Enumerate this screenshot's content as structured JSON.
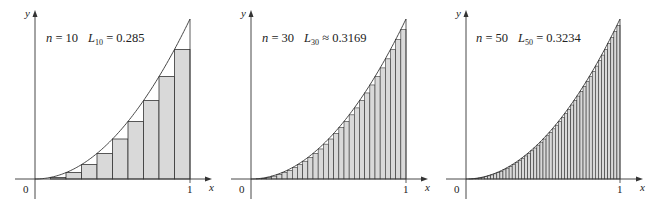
{
  "figure": {
    "colors": {
      "bar_fill": "#d9d9d9",
      "stroke": "#333333",
      "background": "#ffffff"
    }
  },
  "panels": [
    {
      "n_label": "n = 10",
      "L_symbol": "L",
      "L_sub": "10",
      "relation": "=",
      "L_value": "0.285",
      "axis_x_label": "x",
      "axis_y_label": "y",
      "origin_label": "0",
      "tick_x_label": "1"
    },
    {
      "n_label": "n = 30",
      "L_symbol": "L",
      "L_sub": "30",
      "relation": "≈",
      "L_value": "0.3169",
      "axis_x_label": "x",
      "axis_y_label": "y",
      "origin_label": "0",
      "tick_x_label": "1"
    },
    {
      "n_label": "n = 50",
      "L_symbol": "L",
      "L_sub": "50",
      "relation": "=",
      "L_value": "0.3234",
      "axis_x_label": "x",
      "axis_y_label": "y",
      "origin_label": "0",
      "tick_x_label": "1"
    }
  ],
  "chart_data": [
    {
      "type": "bar",
      "title": "n = 10  L10 = 0.285",
      "function": "y = x^2",
      "n": 10,
      "method": "left endpoint",
      "x": [
        0.0,
        0.1,
        0.2,
        0.3,
        0.4,
        0.5,
        0.6,
        0.7,
        0.8,
        0.9
      ],
      "values": [
        0.0,
        0.01,
        0.04,
        0.09,
        0.16,
        0.25,
        0.36,
        0.49,
        0.64,
        0.81
      ],
      "sum": 0.285,
      "xlabel": "x",
      "ylabel": "y",
      "xlim": [
        0,
        1
      ],
      "ylim": [
        0,
        1
      ],
      "x_ticks": [
        "0",
        "1"
      ],
      "grid": false
    },
    {
      "type": "bar",
      "title": "n = 30  L30 ≈ 0.3169",
      "function": "y = x^2",
      "n": 30,
      "method": "left endpoint",
      "sum": 0.3169,
      "xlabel": "x",
      "ylabel": "y",
      "xlim": [
        0,
        1
      ],
      "ylim": [
        0,
        1
      ],
      "x_ticks": [
        "0",
        "1"
      ],
      "grid": false
    },
    {
      "type": "bar",
      "title": "n = 50  L50 = 0.3234",
      "function": "y = x^2",
      "n": 50,
      "method": "left endpoint",
      "sum": 0.3234,
      "xlabel": "x",
      "ylabel": "y",
      "xlim": [
        0,
        1
      ],
      "ylim": [
        0,
        1
      ],
      "x_ticks": [
        "0",
        "1"
      ],
      "grid": false
    }
  ],
  "layout": [
    {
      "ox": 35,
      "oy": 179,
      "w": 155,
      "h": 160,
      "xaxis_end": 212,
      "yaxis_top": 10,
      "n": 10,
      "label_x": 46,
      "label_y": 42
    },
    {
      "ox": 251,
      "oy": 179,
      "w": 155,
      "h": 160,
      "xaxis_end": 428,
      "yaxis_top": 10,
      "n": 30,
      "label_x": 262,
      "label_y": 42
    },
    {
      "ox": 466,
      "oy": 179,
      "w": 154,
      "h": 160,
      "xaxis_end": 643,
      "yaxis_top": 10,
      "n": 50,
      "label_x": 476,
      "label_y": 42
    }
  ]
}
